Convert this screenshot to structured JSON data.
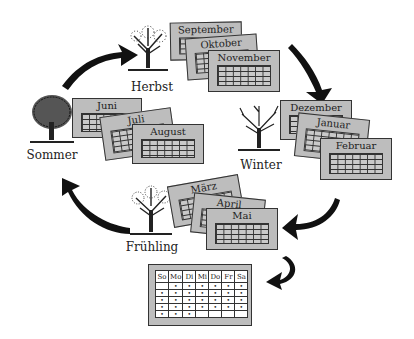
{
  "diagram": {
    "type": "seasonal-calendar-cycle",
    "seasons": [
      {
        "name": "Herbst",
        "months": [
          "September",
          "Oktober",
          "November"
        ]
      },
      {
        "name": "Winter",
        "months": [
          "Dezember",
          "Januar",
          "Februar"
        ]
      },
      {
        "name": "Frühling",
        "months": [
          "März",
          "April",
          "Mai"
        ]
      },
      {
        "name": "Sommer",
        "months": [
          "Juni",
          "Juli",
          "August"
        ]
      }
    ],
    "flow": [
      "Herbst",
      "Winter",
      "Frühling",
      "Sommer",
      "Herbst"
    ],
    "week_calendar": {
      "days": [
        "So",
        "Mo",
        "Di",
        "Mi",
        "Do",
        "Fr",
        "Sa"
      ],
      "rows": [
        [
          "",
          "•",
          "•",
          "•",
          "•",
          "•",
          "•"
        ],
        [
          "•",
          "•",
          "•",
          "•",
          "•",
          "•",
          "•"
        ],
        [
          "•",
          "•",
          "•",
          "•",
          "•",
          "•",
          "•"
        ],
        [
          "•",
          "•",
          "•",
          "•",
          "•",
          "•",
          "•"
        ],
        [
          "•",
          "•",
          "•",
          "",
          "",
          "",
          ""
        ]
      ]
    }
  }
}
